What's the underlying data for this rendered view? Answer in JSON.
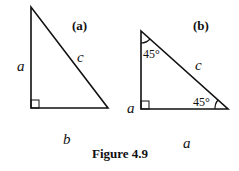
{
  "figure": {
    "caption": "Figure 4.9",
    "panel_a": {
      "tag": "(a)",
      "vertical_side": "a",
      "horizontal_side": "b",
      "hypotenuse": "c"
    },
    "panel_b": {
      "tag": "(b)",
      "vertical_side": "a",
      "horizontal_side": "a",
      "hypotenuse": "c",
      "top_angle": "45°",
      "bottom_angle": "45°"
    }
  },
  "colors": {
    "stroke": "#111111",
    "background": "#ffffff"
  }
}
